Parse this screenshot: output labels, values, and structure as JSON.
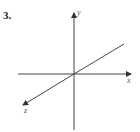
{
  "problem": {
    "number": "3."
  },
  "diagram": {
    "type": "3d-coordinate-axes",
    "axes": [
      {
        "name": "x",
        "label": "x"
      },
      {
        "name": "y",
        "label": "y"
      },
      {
        "name": "z",
        "label": "z"
      }
    ],
    "colors": {
      "axis": "#333333",
      "label": "#555555"
    }
  }
}
